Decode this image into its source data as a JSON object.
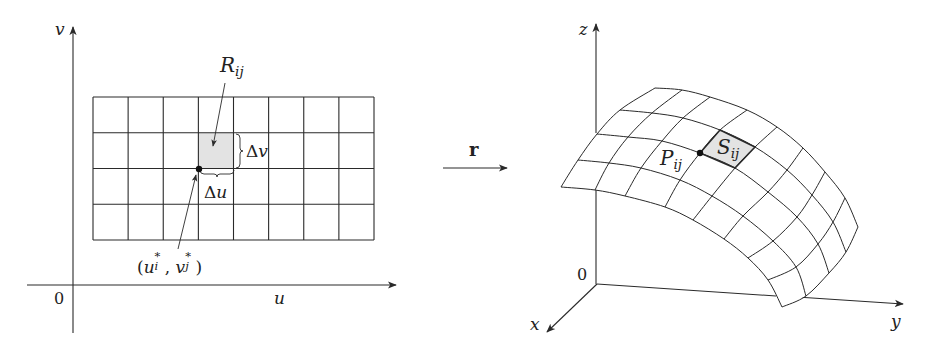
{
  "figure": {
    "stroke_color": "#2a2a2a",
    "shade_color": "#e3e3e3",
    "background": "#ffffff"
  },
  "left_panel": {
    "axes": {
      "u_label": "u",
      "v_label": "v",
      "origin_label": "0"
    },
    "grid": {
      "columns": 8,
      "rows": 4,
      "x0": 93,
      "x1": 374,
      "y0": 97,
      "y1": 240
    },
    "shaded_cell": {
      "col": 3,
      "row": 1
    },
    "labels": {
      "region": {
        "main": "R",
        "sub": "ij"
      },
      "delta_v": {
        "delta": "Δ",
        "var": "v"
      },
      "delta_u": {
        "delta": "Δ",
        "var": "u"
      },
      "sample_point": {
        "open": "(",
        "u": "u",
        "u_sup": "*",
        "u_sub": "i",
        "comma": ", ",
        "v": "v",
        "v_sup": "*",
        "v_sub": "j",
        "close": ")"
      }
    }
  },
  "mapping": {
    "label": "r"
  },
  "right_panel": {
    "axes": {
      "x_label": "x",
      "y_label": "y",
      "z_label": "z",
      "origin_label": "0"
    },
    "labels": {
      "point": {
        "main": "P",
        "sub": "ij"
      },
      "patch": {
        "main": "S",
        "sub": "ij"
      }
    },
    "surface_nodes": [
      [
        [
          655,
          88
        ],
        [
          682,
          90
        ],
        [
          710,
          97
        ],
        [
          747,
          110
        ],
        [
          777,
          127
        ],
        [
          803,
          148
        ],
        [
          825,
          172
        ],
        [
          845,
          198
        ],
        [
          858,
          227
        ]
      ],
      [
        [
          620,
          110
        ],
        [
          652,
          113
        ],
        [
          683,
          118
        ],
        [
          720,
          130
        ],
        [
          755,
          147
        ],
        [
          787,
          170
        ],
        [
          812,
          195
        ],
        [
          833,
          222
        ],
        [
          846,
          252
        ]
      ],
      [
        [
          597,
          134
        ],
        [
          628,
          137
        ],
        [
          662,
          141
        ],
        [
          700,
          153
        ],
        [
          735,
          168
        ],
        [
          768,
          192
        ],
        [
          797,
          217
        ],
        [
          818,
          244
        ],
        [
          829,
          273
        ]
      ],
      [
        [
          578,
          160
        ],
        [
          609,
          163
        ],
        [
          641,
          168
        ],
        [
          680,
          180
        ],
        [
          712,
          196
        ],
        [
          743,
          216
        ],
        [
          773,
          241
        ],
        [
          796,
          267
        ],
        [
          806,
          296
        ]
      ],
      [
        [
          561,
          187
        ],
        [
          595,
          190
        ],
        [
          625,
          196
        ],
        [
          665,
          207
        ],
        [
          693,
          220
        ],
        [
          724,
          239
        ],
        [
          748,
          258
        ],
        [
          768,
          280
        ],
        [
          782,
          307
        ]
      ]
    ],
    "shaded_patch": {
      "row": 1,
      "col": 3
    }
  }
}
